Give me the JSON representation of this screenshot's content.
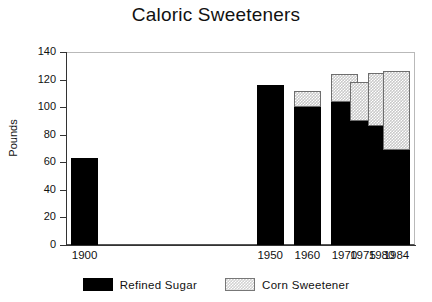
{
  "chart_data": {
    "type": "bar",
    "stacked": true,
    "title": "Caloric Sweeteners",
    "xlabel": "",
    "ylabel": "Pounds",
    "categories": [
      "1900",
      "1950",
      "1960",
      "1970",
      "1975",
      "1980",
      "1984"
    ],
    "series": [
      {
        "name": "Refined Sugar",
        "color": "#000000",
        "values": [
          63,
          116,
          100,
          104,
          90,
          86,
          69
        ]
      },
      {
        "name": "Corn Sweetener",
        "color": "#cccccc",
        "values": [
          0,
          0,
          12,
          20,
          28,
          39,
          57
        ]
      }
    ],
    "totals": [
      63,
      116,
      112,
      124,
      118,
      125,
      126
    ],
    "ylim": [
      0,
      140
    ],
    "yticks": [
      0,
      20,
      40,
      60,
      80,
      100,
      120,
      140
    ],
    "ytick_labels": [
      "0",
      "20",
      "40",
      "60",
      "80",
      "100",
      "120",
      "140"
    ],
    "grid": false,
    "legend_position": "bottom",
    "legend": [
      "Refined Sugar",
      "Corn Sweetener"
    ]
  }
}
